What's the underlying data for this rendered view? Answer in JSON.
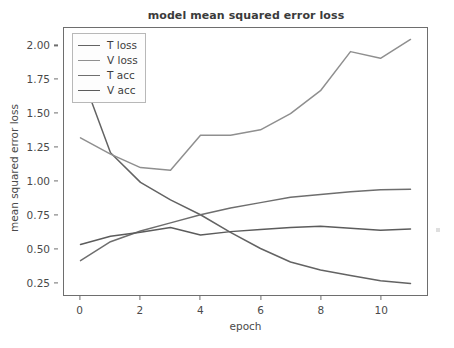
{
  "chart_data": {
    "type": "line",
    "title": "model mean squared error loss",
    "xlabel": "epoch",
    "ylabel": "mean squared error loss",
    "grid": false,
    "legend_position": "upper left",
    "x": [
      0,
      1,
      2,
      3,
      4,
      5,
      6,
      7,
      8,
      9,
      10,
      11
    ],
    "xlim": [
      -0.55,
      11.55
    ],
    "ylim": [
      0.155,
      2.135
    ],
    "xticks": [
      0,
      2,
      4,
      6,
      8,
      10
    ],
    "xticklabels": [
      "0",
      "2",
      "4",
      "6",
      "8",
      "10"
    ],
    "yticks": [
      0.25,
      0.5,
      0.75,
      1.0,
      1.25,
      1.5,
      1.75,
      2.0
    ],
    "yticklabels": [
      "0.25",
      "0.50",
      "0.75",
      "1.00",
      "1.25",
      "1.50",
      "1.75",
      "2.00"
    ],
    "series": [
      {
        "name": "T loss",
        "color": "#636363",
        "values": [
          1.81,
          1.21,
          0.99,
          0.86,
          0.75,
          0.62,
          0.5,
          0.4,
          0.34,
          0.3,
          0.26,
          0.24
        ]
      },
      {
        "name": "V loss",
        "color": "#8f8f8f",
        "values": [
          1.32,
          1.2,
          1.1,
          1.08,
          1.34,
          1.34,
          1.38,
          1.5,
          1.67,
          1.96,
          1.91,
          2.05
        ]
      },
      {
        "name": "T acc",
        "color": "#6e6e6e",
        "values": [
          0.41,
          0.55,
          0.63,
          0.69,
          0.75,
          0.8,
          0.84,
          0.88,
          0.9,
          0.92,
          0.935,
          0.94
        ]
      },
      {
        "name": "V acc",
        "color": "#5c5c5c",
        "values": [
          0.53,
          0.59,
          0.62,
          0.655,
          0.6,
          0.625,
          0.64,
          0.655,
          0.665,
          0.65,
          0.635,
          0.645
        ]
      }
    ]
  },
  "legend": {
    "items": [
      {
        "label": "T loss"
      },
      {
        "label": "V loss"
      },
      {
        "label": "T acc"
      },
      {
        "label": "V acc"
      }
    ]
  },
  "colors": {
    "axis": "#6e6e6e",
    "text": "#4a4a4a",
    "title": "#3b3b3b",
    "background": "#ffffff"
  }
}
